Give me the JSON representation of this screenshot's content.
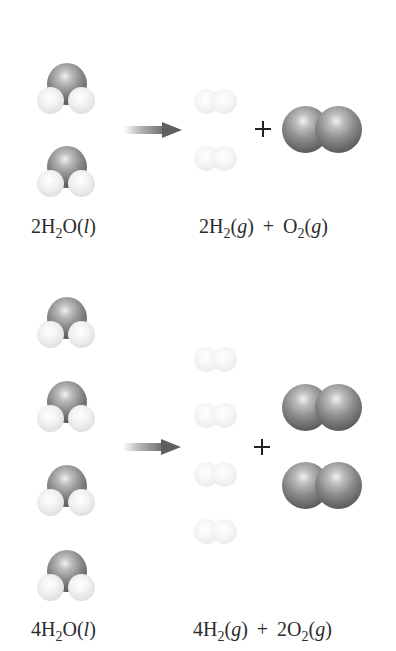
{
  "figure": {
    "colors": {
      "background": "#ffffff",
      "oxygen": "#7a7a7a",
      "hydrogen": "#eeeeee",
      "arrow": "#5f5f5f",
      "text": "#2b2b2b"
    }
  },
  "panels": [
    {
      "id": "top",
      "reactant_label": {
        "coef": "2",
        "formula_a": "H",
        "sub_a": "2",
        "formula_b": "O(",
        "state": "l",
        "close": ")"
      },
      "product_label": {
        "coef1": "2",
        "f1": "H",
        "sub1": "2",
        "open1": "(",
        "state1": "g",
        "close1": ")",
        "plus": "+",
        "coef2": "",
        "f2": "O",
        "sub2": "2",
        "open2": "(",
        "state2": "g",
        "close2": ")"
      },
      "water_count": 2,
      "h2_count": 2,
      "o2_count": 1
    },
    {
      "id": "bottom",
      "reactant_label": {
        "coef": "4",
        "formula_a": "H",
        "sub_a": "2",
        "formula_b": "O(",
        "state": "l",
        "close": ")"
      },
      "product_label": {
        "coef1": "4",
        "f1": "H",
        "sub1": "2",
        "open1": "(",
        "state1": "g",
        "close1": ")",
        "plus": "+",
        "coef2": "2",
        "f2": "O",
        "sub2": "2",
        "open2": "(",
        "state2": "g",
        "close2": ")"
      },
      "water_count": 4,
      "h2_count": 4,
      "o2_count": 2
    }
  ],
  "symbols": {
    "arrow": "reaction-arrow",
    "plus": "+"
  }
}
